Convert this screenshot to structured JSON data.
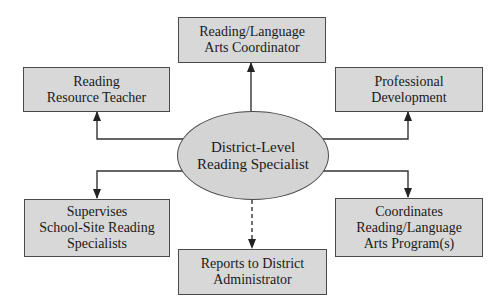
{
  "diagram": {
    "center": {
      "lines": [
        "District-Level",
        "Reading Specialist"
      ]
    },
    "nodes": {
      "top": {
        "lines": [
          "Reading/Language",
          "Arts Coordinator"
        ]
      },
      "upper_left": {
        "lines": [
          "Reading",
          "Resource Teacher"
        ]
      },
      "upper_right": {
        "lines": [
          "Professional",
          "Development"
        ]
      },
      "lower_left": {
        "lines": [
          "Supervises",
          "School-Site Reading",
          "Specialists"
        ]
      },
      "bottom": {
        "lines": [
          "Reports to District",
          "Administrator"
        ]
      },
      "lower_right": {
        "lines": [
          "Coordinates",
          "Reading/Language",
          "Arts Program(s)"
        ]
      }
    },
    "edges": [
      {
        "from": "center",
        "to": "top",
        "style": "solid"
      },
      {
        "from": "center",
        "to": "upper_left",
        "style": "solid"
      },
      {
        "from": "center",
        "to": "upper_right",
        "style": "solid"
      },
      {
        "from": "center",
        "to": "lower_left",
        "style": "solid"
      },
      {
        "from": "center",
        "to": "lower_right",
        "style": "solid"
      },
      {
        "from": "center",
        "to": "bottom",
        "style": "dashed"
      }
    ],
    "colors": {
      "box_fill": "#d8d8d8",
      "ellipse_fill": "#d4d4d4",
      "stroke": "#4a4a4a"
    }
  }
}
